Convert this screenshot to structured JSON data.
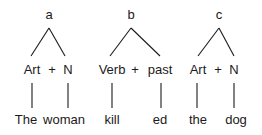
{
  "trees": [
    {
      "root": "a",
      "nodes": [
        {
          "label": "Art"
        },
        {
          "label": "N"
        }
      ],
      "join": "+",
      "leaves": [
        "The",
        "woman"
      ]
    },
    {
      "root": "b",
      "nodes": [
        {
          "label": "Verb"
        },
        {
          "label": "past"
        }
      ],
      "join": "+",
      "leaves": [
        "kill",
        "ed"
      ]
    },
    {
      "root": "c",
      "nodes": [
        {
          "label": "Art"
        },
        {
          "label": "N"
        }
      ],
      "join": "+",
      "leaves": [
        "the",
        "dog"
      ]
    }
  ]
}
